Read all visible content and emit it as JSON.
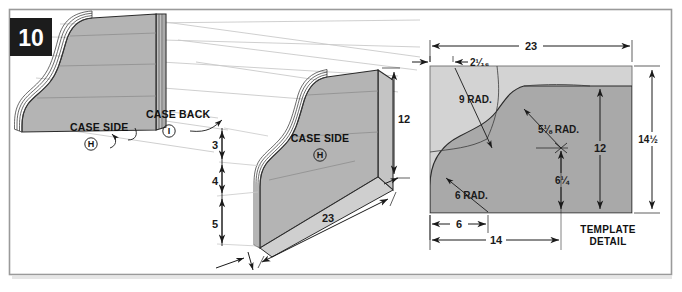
{
  "figure": {
    "step_number": "10",
    "border_color": "#9a9a9a",
    "background_color": "#ffffff"
  },
  "colors": {
    "panel_fill_light": "#d3d3d3",
    "panel_fill_mid": "#b8b8b8",
    "panel_fill_dark": "#a9a9a9",
    "edge_stroke": "#2b2b2b",
    "construction_line": "#c9c9c9",
    "dimension_line": "#1a1a1a",
    "badge_bg": "#1c1c1c"
  },
  "isometric_view": {
    "labels": [
      {
        "name": "case-side",
        "text": "CASE SIDE",
        "key": "H"
      },
      {
        "name": "case-back",
        "text": "CASE BACK",
        "key": "I"
      }
    ]
  },
  "side_panel_view": {
    "label": {
      "text": "CASE SIDE",
      "key": "H"
    },
    "dimensions": [
      {
        "name": "height-overall",
        "value": "12",
        "orientation": "vertical"
      },
      {
        "name": "length-overall",
        "value": "23",
        "orientation": "diagonal"
      },
      {
        "name": "chain-seg-1",
        "value": "3",
        "orientation": "vertical"
      },
      {
        "name": "chain-seg-2",
        "value": "4",
        "orientation": "vertical"
      },
      {
        "name": "chain-seg-3",
        "value": "5",
        "orientation": "vertical"
      }
    ]
  },
  "template_detail": {
    "title_line_1": "TEMPLATE",
    "title_line_2": "DETAIL",
    "dimensions": [
      {
        "name": "overall-width",
        "value": "23"
      },
      {
        "name": "offset-left",
        "value": "2¹⁄₁₆"
      },
      {
        "name": "overall-height",
        "value": "14½"
      },
      {
        "name": "height-12",
        "value": "12"
      },
      {
        "name": "height-6-quarter",
        "value": "6¼"
      },
      {
        "name": "base-6",
        "value": "6"
      },
      {
        "name": "base-14",
        "value": "14"
      }
    ],
    "radii": [
      {
        "name": "rad-9",
        "value": "9 RAD."
      },
      {
        "name": "rad-5-eighth",
        "value": "5⅛ RAD."
      },
      {
        "name": "rad-6",
        "value": "6 RAD."
      }
    ]
  }
}
